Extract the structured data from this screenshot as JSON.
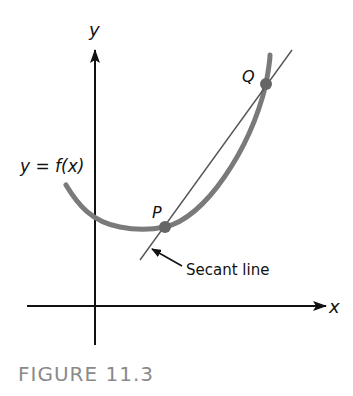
{
  "figure": {
    "caption": "FIGURE 11.3",
    "axes": {
      "x_label": "x",
      "y_label": "y"
    },
    "function_label": "y = f(x)",
    "points": [
      {
        "name": "P",
        "label": "P"
      },
      {
        "name": "Q",
        "label": "Q"
      }
    ],
    "annotation": "Secant line",
    "colors": {
      "curve": "#7a7a7a",
      "axes": "#111111",
      "secant": "#555555",
      "caption": "#8a8a8a"
    }
  }
}
